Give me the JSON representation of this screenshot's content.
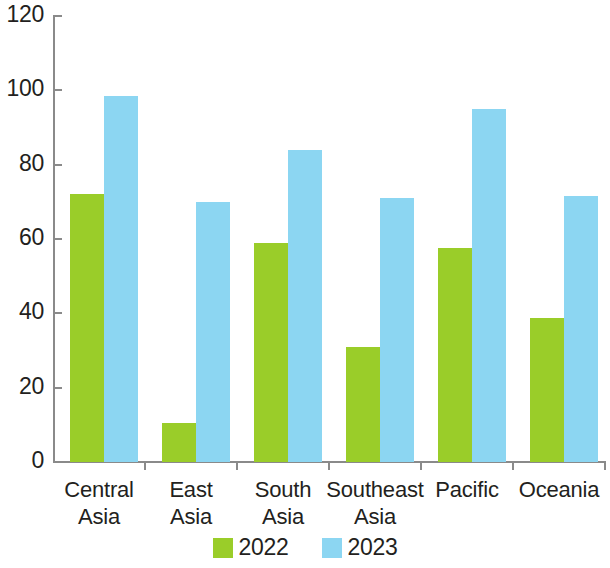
{
  "chart_data": {
    "type": "bar",
    "title": "",
    "subtitle": "",
    "xlabel": "",
    "ylabel": "",
    "ylim": [
      0,
      120
    ],
    "ytick_step": 20,
    "yticks": [
      "120",
      "100",
      "80",
      "60",
      "40",
      "20",
      "0"
    ],
    "grid": false,
    "legend_position": "bottom-center",
    "categories": [
      "Central\nAsia",
      "East\nAsia",
      "South\nAsia",
      "Southeast\nAsia",
      "Pacific",
      "Oceania"
    ],
    "series": [
      {
        "name": "2022",
        "color": "#9acd29",
        "values": [
          72,
          10.5,
          59,
          31,
          57.5,
          38.8
        ]
      },
      {
        "name": "2023",
        "color": "#8cd6f2",
        "values": [
          98.5,
          70,
          84,
          71,
          95,
          71.5
        ]
      }
    ]
  },
  "legend": {
    "items": [
      {
        "label": "2022",
        "color": "#9acd29"
      },
      {
        "label": "2023",
        "color": "#8cd6f2"
      }
    ]
  },
  "axis": {
    "line_color": "#8a8a8a",
    "text_color": "#231f20"
  }
}
